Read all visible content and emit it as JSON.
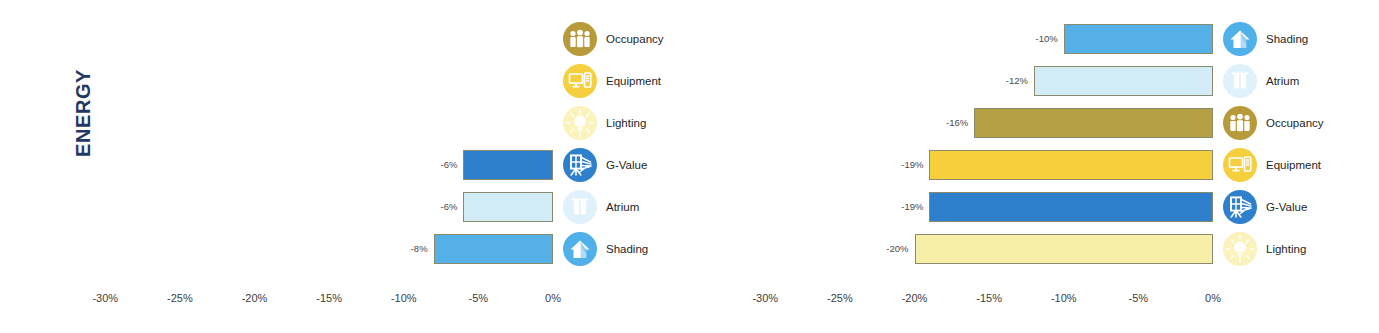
{
  "axis_title": "ENERGY",
  "accent_color": "#1f3864",
  "category_styles": {
    "Occupancy": {
      "fill": "#b5a043",
      "icon_bg": "#b79a3a",
      "icon": "occupancy-icon"
    },
    "Equipment": {
      "fill": "#f5d03c",
      "icon_bg": "#f6cf3f",
      "icon": "equipment-icon"
    },
    "Lighting": {
      "fill": "#f7efa8",
      "icon_bg": "#fbf3bb",
      "icon": "lighting-icon"
    },
    "G-Value": {
      "fill": "#2e7fcc",
      "icon_bg": "#2e7fcc",
      "icon": "g-value-icon"
    },
    "Atrium": {
      "fill": "#d3edf8",
      "icon_bg": "#dff2fb",
      "icon": "atrium-icon"
    },
    "Shading": {
      "fill": "#55b0e8",
      "icon_bg": "#4fb0ea",
      "icon": "shading-icon"
    }
  },
  "chart_data": [
    {
      "id": "energy-left-chart",
      "type": "bar",
      "orientation": "horizontal",
      "title": "",
      "xlabel": "",
      "ylabel": "ENERGY",
      "xlim": [
        -32.5,
        0
      ],
      "xticks": [
        -30,
        -25,
        -20,
        -15,
        -10,
        -5,
        0
      ],
      "xticklabels": [
        "-30%",
        "-25%",
        "-20%",
        "-15%",
        "-10%",
        "-5%",
        "0%"
      ],
      "grid": false,
      "legend": "right-of-zero-line",
      "categories": [
        "Occupancy",
        "Equipment",
        "Lighting",
        "G-Value",
        "Atrium",
        "Shading"
      ],
      "values": [
        0,
        0,
        0,
        -6,
        -6,
        -8
      ],
      "datalabels": [
        "",
        "",
        "",
        "-6%",
        "-6%",
        "-8%"
      ]
    },
    {
      "id": "energy-right-chart",
      "type": "bar",
      "orientation": "horizontal",
      "title": "",
      "xlabel": "",
      "ylabel": "",
      "xlim": [
        -32.5,
        0
      ],
      "xticks": [
        -30,
        -25,
        -20,
        -15,
        -10,
        -5,
        0
      ],
      "xticklabels": [
        "-30%",
        "-25%",
        "-20%",
        "-15%",
        "-10%",
        "-5%",
        "0%"
      ],
      "grid": false,
      "legend": "right-of-zero-line",
      "categories": [
        "Shading",
        "Atrium",
        "Occupancy",
        "Equipment",
        "G-Value",
        "Lighting"
      ],
      "values": [
        -10,
        -12,
        -16,
        -19,
        -19,
        -20
      ],
      "datalabels": [
        "-10%",
        "-12%",
        "-16%",
        "-19%",
        "-19%",
        "-20%"
      ]
    }
  ]
}
